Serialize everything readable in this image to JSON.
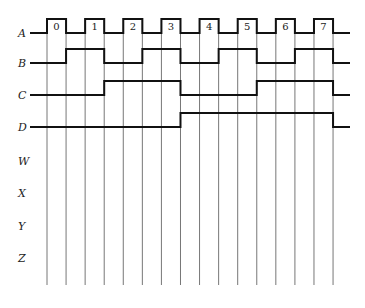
{
  "diagram": {
    "type": "timing-diagram",
    "gridlines": {
      "count": 16,
      "x_start": 47,
      "spacing": 19.07,
      "y_top": 18,
      "y_bottom": 285,
      "color": "#777777"
    },
    "wave_start_x": 30,
    "wave_end_x": 350,
    "amplitude": 14,
    "signals": [
      {
        "name": "A",
        "low_y": 33,
        "high_intervals": [
          [
            0,
            1
          ],
          [
            2,
            3
          ],
          [
            4,
            5
          ],
          [
            6,
            7
          ],
          [
            8,
            9
          ],
          [
            10,
            11
          ],
          [
            12,
            13
          ],
          [
            14,
            15
          ]
        ],
        "pulse_labels": [
          "0",
          "1",
          "2",
          "3",
          "4",
          "5",
          "6",
          "7"
        ]
      },
      {
        "name": "B",
        "low_y": 63,
        "high_intervals": [
          [
            1,
            3
          ],
          [
            5,
            7
          ],
          [
            9,
            11
          ],
          [
            13,
            15
          ]
        ]
      },
      {
        "name": "C",
        "low_y": 95,
        "high_intervals": [
          [
            3,
            7
          ],
          [
            11,
            15
          ]
        ]
      },
      {
        "name": "D",
        "low_y": 127,
        "high_intervals": [
          [
            7,
            15
          ]
        ]
      },
      {
        "name": "W",
        "label_y": 161
      },
      {
        "name": "X",
        "label_y": 193
      },
      {
        "name": "Y",
        "label_y": 226
      },
      {
        "name": "Z",
        "label_y": 258
      }
    ],
    "colors": {
      "wave": "#111111",
      "grid": "#777777",
      "background": "#ffffff"
    }
  }
}
